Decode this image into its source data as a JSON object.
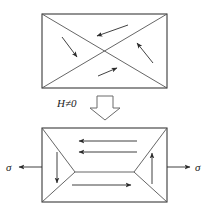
{
  "figure": {
    "title": "",
    "labels": {
      "field_condition": "H≠0",
      "stress_left": "σ",
      "stress_right": "σ"
    },
    "icons": {
      "transition": "block-down-arrow-icon"
    },
    "colors": {
      "line": "#3a3a3a",
      "background": "#ffffff",
      "arrow": "#2b2b2b"
    },
    "panels": [
      {
        "name": "initial-state-panel",
        "caption": "",
        "rect": {
          "x": 42,
          "y": 14,
          "w": 125,
          "h": 74
        },
        "domain_walls": [
          {
            "name": "diagonal-wall-tl-br",
            "x1": 42,
            "y1": 14,
            "x2": 167,
            "y2": 88
          },
          {
            "name": "diagonal-wall-bl-tr",
            "x1": 42,
            "y1": 88,
            "x2": 167,
            "y2": 14
          }
        ],
        "magnetization_arrows": [
          {
            "name": "top-domain-arrow",
            "dir": "up-left",
            "x1": 128,
            "y1": 25,
            "x2": 95,
            "y2": 37
          },
          {
            "name": "left-domain-arrow",
            "dir": "down-right",
            "x1": 62,
            "y1": 37,
            "x2": 79,
            "y2": 59
          },
          {
            "name": "bottom-domain-arrow",
            "dir": "up-right",
            "x1": 98,
            "y1": 76,
            "x2": 119,
            "y2": 67
          },
          {
            "name": "right-domain-arrow",
            "dir": "up-left",
            "x1": 153,
            "y1": 63,
            "x2": 136,
            "y2": 41
          }
        ]
      },
      {
        "name": "stressed-state-panel",
        "caption": "",
        "rect": {
          "x": 42,
          "y": 128,
          "w": 125,
          "h": 74
        },
        "domain_walls": [
          {
            "name": "wall-left-upper",
            "x1": 42,
            "y1": 128,
            "x2": 75,
            "y2": 172
          },
          {
            "name": "wall-left-lower",
            "x1": 75,
            "y1": 172,
            "x2": 42,
            "y2": 202
          },
          {
            "name": "wall-right-upper",
            "x1": 167,
            "y1": 128,
            "x2": 134,
            "y2": 172
          },
          {
            "name": "wall-right-lower",
            "x1": 134,
            "y1": 172,
            "x2": 167,
            "y2": 202
          },
          {
            "name": "wall-horizontal-median",
            "x1": 75,
            "y1": 172,
            "x2": 134,
            "y2": 172
          }
        ],
        "magnetization_arrows": [
          {
            "name": "upper-domain-arrow-1",
            "dir": "left",
            "x1": 137,
            "y1": 141,
            "x2": 78,
            "y2": 141
          },
          {
            "name": "upper-domain-arrow-2",
            "dir": "left",
            "x1": 137,
            "y1": 152,
            "x2": 78,
            "y2": 152
          },
          {
            "name": "lower-domain-arrow",
            "dir": "right",
            "x1": 72,
            "y1": 185,
            "x2": 132,
            "y2": 185
          },
          {
            "name": "left-domain-arrow",
            "dir": "down",
            "x1": 57,
            "y1": 152,
            "x2": 57,
            "y2": 184
          },
          {
            "name": "right-domain-arrow",
            "dir": "up",
            "x1": 152,
            "y1": 184,
            "x2": 152,
            "y2": 152
          }
        ],
        "stress_arrows": [
          {
            "name": "stress-arrow-left",
            "dir": "left",
            "x1": 42,
            "y1": 167,
            "x2": 18,
            "y2": 167
          },
          {
            "name": "stress-arrow-right",
            "dir": "right",
            "x1": 167,
            "y1": 167,
            "x2": 191,
            "y2": 167
          }
        ]
      }
    ]
  }
}
